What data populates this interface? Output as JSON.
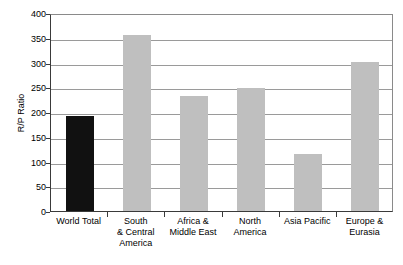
{
  "chart_data": {
    "type": "bar",
    "title": "",
    "xlabel": "",
    "ylabel": "R/P Ratio",
    "ylim": [
      0,
      400
    ],
    "ytick_values": [
      0,
      50,
      100,
      150,
      200,
      250,
      300,
      350,
      400
    ],
    "ytick_labels": [
      "0",
      "50",
      "100",
      "150",
      "200",
      "250",
      "300",
      "350",
      "400"
    ],
    "grid": true,
    "legend": "none",
    "categories": [
      "World Total",
      "South & Central America",
      "Africa & Middle East",
      "North America",
      "Asia Pacific",
      "Europe & Eurasia"
    ],
    "category_lines": [
      [
        "World Total"
      ],
      [
        "South",
        "& Central",
        "America"
      ],
      [
        "Africa &",
        "Middle East"
      ],
      [
        "North",
        "America"
      ],
      [
        "Asia Pacific"
      ],
      [
        "Europe &",
        "Eurasia"
      ]
    ],
    "values": [
      192,
      355,
      233,
      249,
      115,
      301
    ],
    "bar_colors": [
      "#111111",
      "#bfbfbf",
      "#bfbfbf",
      "#bfbfbf",
      "#bfbfbf",
      "#bfbfbf"
    ],
    "highlight_color": "#111111",
    "series_color": "#bfbfbf",
    "axis_color": "#3a3a3a",
    "grid_color": "#9a9a9a"
  }
}
